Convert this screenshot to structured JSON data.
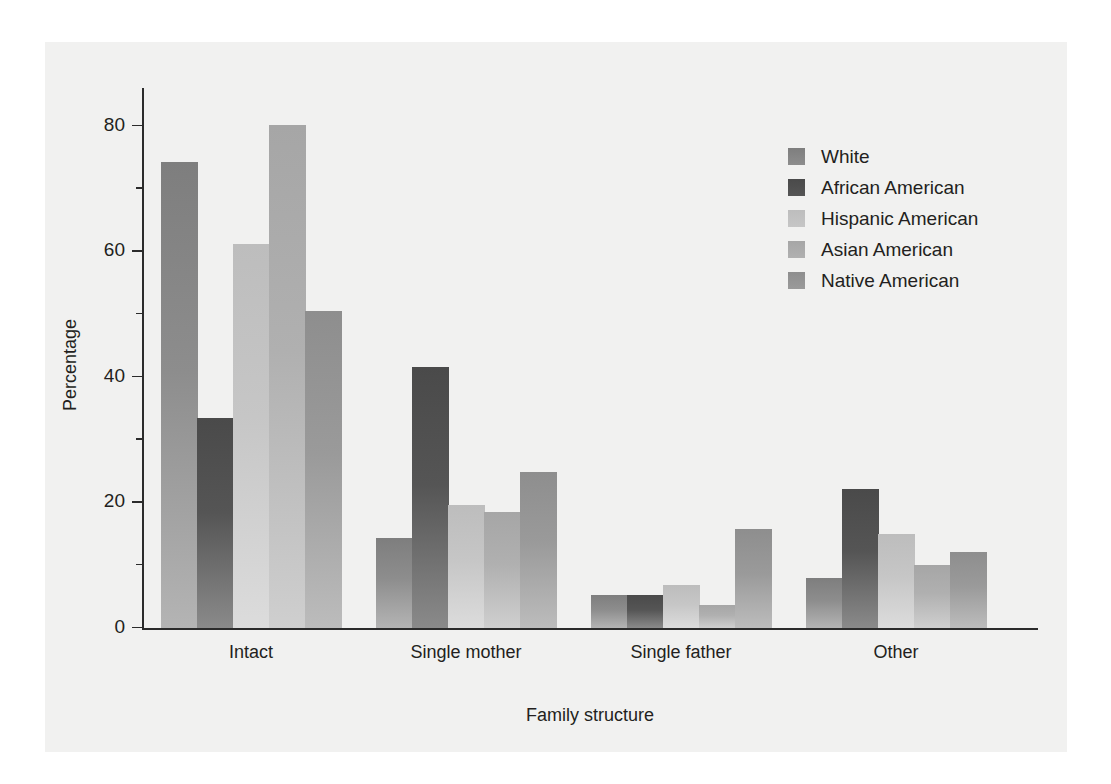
{
  "chart_data": {
    "type": "bar",
    "title": "",
    "xlabel": "Family structure",
    "ylabel": "Percentage",
    "categories": [
      "Intact",
      "Single mother",
      "Single father",
      "Other"
    ],
    "ylim": [
      0,
      84
    ],
    "yticks": [
      0,
      20,
      40,
      60,
      80
    ],
    "ytick_labels": [
      "0",
      "20",
      "40",
      "60",
      "80"
    ],
    "yticks_minor": [
      10,
      30,
      50,
      70
    ],
    "grid": false,
    "legend_position": "top-right",
    "series": [
      {
        "name": "White",
        "color": "#8d8d8d",
        "color_top": "#7e7e7e",
        "color_bottom": "#b4b4b4",
        "values": [
          74.2,
          14.4,
          5.3,
          8.0
        ]
      },
      {
        "name": "African American",
        "color": "#555555",
        "color_top": "#4a4a4a",
        "color_bottom": "#8a8a8a",
        "values": [
          33.4,
          41.6,
          5.3,
          22.2
        ]
      },
      {
        "name": "Hispanic American",
        "color": "#c6c6c6",
        "color_top": "#bdbdbd",
        "color_bottom": "#dcdcdc",
        "values": [
          61.2,
          19.6,
          6.8,
          15.0
        ]
      },
      {
        "name": "Asian American",
        "color": "#b0b0b0",
        "color_top": "#a6a6a6",
        "color_bottom": "#cfcfcf",
        "values": [
          80.2,
          18.5,
          3.7,
          10.0
        ]
      },
      {
        "name": "Native American",
        "color": "#9a9a9a",
        "color_top": "#8e8e8e",
        "color_bottom": "#bcbcbc",
        "values": [
          50.5,
          24.8,
          15.8,
          12.1
        ]
      }
    ]
  }
}
